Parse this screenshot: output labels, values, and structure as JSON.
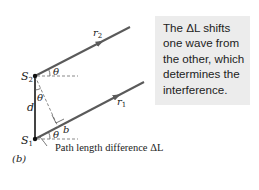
{
  "diagram": {
    "panel_label": "(b)",
    "sources": {
      "top": "S",
      "top_sub": "2",
      "bottom": "S",
      "bottom_sub": "1"
    },
    "rays": {
      "top": "r",
      "top_sub": "2",
      "bottom": "r",
      "bottom_sub": "1"
    },
    "separation_label": "d",
    "angle_label": "θ",
    "point_label": "b",
    "path_label": "Path length difference ΔL"
  },
  "callout": {
    "lines": [
      "The ΔL shifts",
      "one wave from",
      "the other, which",
      "determines the",
      "interference."
    ]
  },
  "colors": {
    "ray": "#5a5a5a",
    "callout_bg": "#ececec",
    "text": "#222222"
  }
}
